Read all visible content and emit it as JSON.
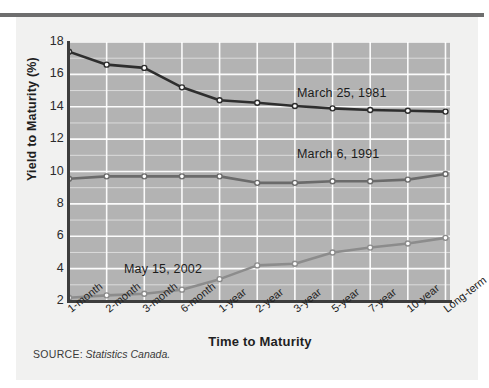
{
  "figure": {
    "source_label": "SOURCE:",
    "source_value": "Statistics Canada."
  },
  "chart_data": {
    "type": "line",
    "title": "",
    "xlabel": "Time to Maturity",
    "ylabel": "Yield to Maturity (%)",
    "ylim": [
      2,
      18
    ],
    "ytick_step": 2,
    "yticks": [
      18,
      16,
      14,
      12,
      10,
      8,
      6,
      4,
      2
    ],
    "grid": true,
    "grid_color": "#ffffff",
    "plot_background": "#b3b3b3",
    "legend": "inline-annotations",
    "categories": [
      "1-month",
      "2-month",
      "3-month",
      "6-month",
      "1-year",
      "2-year",
      "3-year",
      "5-year",
      "7-year",
      "10-year",
      "Long-term"
    ],
    "series": [
      {
        "name": "March 25, 1981",
        "color": "#2e2e2e",
        "marker": "circle",
        "marker_fill": "#ffffff",
        "values": [
          17.4,
          16.6,
          16.4,
          15.2,
          14.4,
          14.25,
          14.05,
          13.9,
          13.8,
          13.75,
          13.7
        ]
      },
      {
        "name": "March 6, 1991",
        "color": "#6b6b6b",
        "marker": "circle",
        "marker_fill": "#ffffff",
        "values": [
          9.55,
          9.7,
          9.7,
          9.7,
          9.7,
          9.3,
          9.3,
          9.4,
          9.4,
          9.5,
          9.85
        ]
      },
      {
        "name": "May 15, 2002",
        "color": "#8c8c8c",
        "marker": "circle",
        "marker_fill": "#ffffff",
        "values": [
          2.2,
          2.35,
          2.45,
          2.7,
          3.35,
          4.2,
          4.3,
          5.0,
          5.3,
          5.55,
          5.9
        ]
      }
    ]
  }
}
